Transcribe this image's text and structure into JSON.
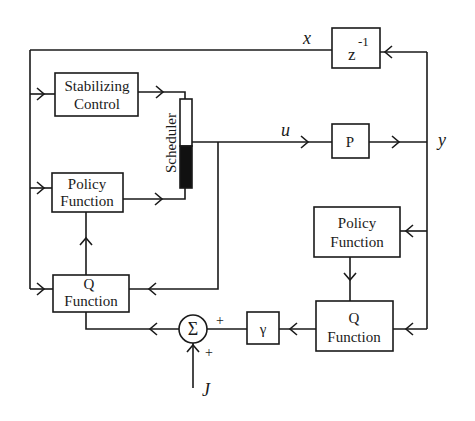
{
  "diagram": {
    "type": "block-diagram",
    "background": "#ffffff",
    "stroke_color": "#1a1a1a",
    "blocks": {
      "stabilizing_control": {
        "line1": "Stabilizing",
        "line2": "Control"
      },
      "policy_left": {
        "line1": "Policy",
        "line2": "Function"
      },
      "q_left": {
        "line1": "Q",
        "line2": "Function"
      },
      "scheduler": {
        "label": "Scheduler"
      },
      "delay": {
        "base": "z",
        "exponent": "-1"
      },
      "plant": {
        "label": "P"
      },
      "policy_right": {
        "line1": "Policy",
        "line2": "Function"
      },
      "q_right": {
        "line1": "Q",
        "line2": "Function"
      },
      "discount": {
        "label": "γ"
      },
      "sum": {
        "label": "Σ",
        "sign_top": "+",
        "sign_bottom": "+"
      }
    },
    "signals": {
      "x": "x",
      "u": "u",
      "y": "y",
      "J": "J"
    },
    "connections": [
      {
        "from": "y",
        "to": "delay"
      },
      {
        "from": "delay",
        "to": "stabilizing_control",
        "signal": "x"
      },
      {
        "from": "delay",
        "to": "policy_left",
        "signal": "x"
      },
      {
        "from": "delay",
        "to": "q_left",
        "signal": "x"
      },
      {
        "from": "stabilizing_control",
        "to": "scheduler"
      },
      {
        "from": "policy_left",
        "to": "scheduler"
      },
      {
        "from": "scheduler",
        "to": "plant",
        "signal": "u"
      },
      {
        "from": "scheduler",
        "to": "q_left",
        "signal": "u"
      },
      {
        "from": "q_left",
        "to": "policy_left"
      },
      {
        "from": "plant",
        "to": "y"
      },
      {
        "from": "y",
        "to": "policy_right"
      },
      {
        "from": "y",
        "to": "q_right"
      },
      {
        "from": "policy_right",
        "to": "q_right"
      },
      {
        "from": "q_right",
        "to": "discount"
      },
      {
        "from": "discount",
        "to": "sum",
        "sign": "+"
      },
      {
        "from": "J",
        "to": "sum",
        "sign": "+"
      },
      {
        "from": "sum",
        "to": "q_left"
      }
    ]
  }
}
